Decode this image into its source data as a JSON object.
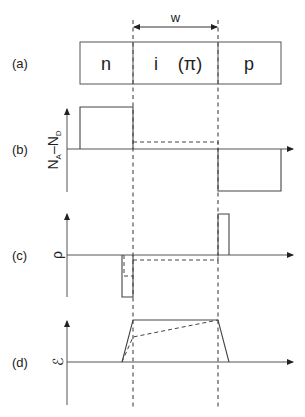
{
  "figure": {
    "width_label": "w",
    "panels": [
      {
        "id": "a",
        "label": "(a)",
        "regions": [
          "n",
          "i",
          "(π)",
          "p"
        ]
      },
      {
        "id": "b",
        "label": "(b)",
        "ylabel_main": "N",
        "ylabel_sub_a": "A",
        "ylabel_dash": "–",
        "ylabel_sub_d": "D",
        "description": "Net doping profile"
      },
      {
        "id": "c",
        "label": "(c)",
        "ylabel": "ρ",
        "description": "Charge density"
      },
      {
        "id": "d",
        "label": "(d)",
        "ylabel": "ℰ",
        "description": "Electric field"
      }
    ],
    "curves": {
      "b_solid": "n-region positive step, i-region zero, p-region negative step",
      "b_dashed": "i-region (π) small positive level",
      "c_solid": "negative charge spike at n/i edge, positive charge spike at i/p edge",
      "c_dashed": "distributed negative charge in π region",
      "d_solid": "trapezoidal constant field across i region",
      "d_dashed": "linearly rising field across π region"
    }
  }
}
